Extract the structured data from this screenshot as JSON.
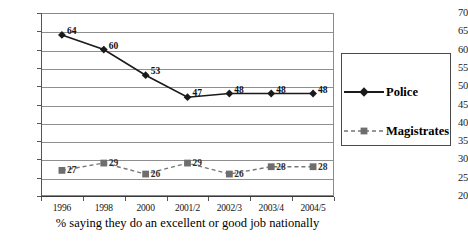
{
  "chart_data": {
    "type": "line",
    "title": "",
    "subtitle": "",
    "xlabel": "% saying they do an excellent or good job nationally",
    "ylabel": "",
    "categories": [
      "1996",
      "1998",
      "2000",
      "2001/2",
      "2002/3",
      "2003/4",
      "2004/5"
    ],
    "series": [
      {
        "name": "Police",
        "values": [
          64,
          60,
          53,
          47,
          48,
          48,
          48
        ],
        "marker": "diamond",
        "line_style": "solid",
        "color": "#1a1a1a"
      },
      {
        "name": "Magistrates",
        "values": [
          27,
          29,
          26,
          29,
          26,
          28,
          28
        ],
        "marker": "square",
        "line_style": "dashed",
        "color": "#6e6e6e"
      }
    ],
    "ylim": [
      20,
      70
    ],
    "ytick_labels": [
      "70",
      "65",
      "60",
      "55",
      "50",
      "45",
      "40",
      "35",
      "30",
      "25",
      "20"
    ],
    "ytick_step": 5,
    "grid": "horizontal",
    "legend_position": "right-outside",
    "legend_entries": [
      "Police",
      "Magistrates"
    ],
    "data_labels_shown": true
  },
  "axis_caption": "% saying they do an excellent or good job nationally",
  "legend": {
    "police_label": "Police",
    "magistrates_label": "Magistrates"
  }
}
